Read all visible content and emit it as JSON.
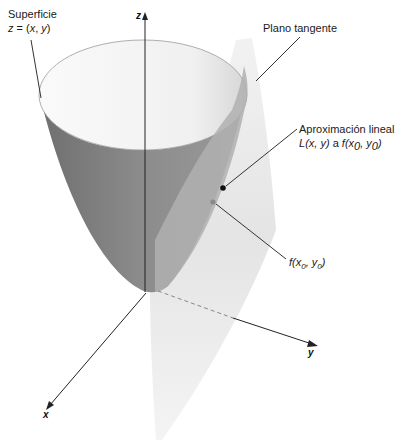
{
  "figure": {
    "colors": {
      "background": "#ffffff",
      "surface_outer": "#8f8f8f",
      "surface_outer_dark": "#7a7a7a",
      "surface_inner": "#f3f3f3",
      "surface_inner_shade": "#d9d9d9",
      "plane": "#e6e6e6",
      "plane_on_surface": "#b3b3b3",
      "point_linear": "#111111",
      "point_surface": "#8a8a8a",
      "leader_line": "#333333",
      "axis": "#222222"
    },
    "labels": {
      "surface": {
        "line1": "Superficie",
        "line2_prefix": "z",
        "line2_rest": " = (",
        "line2_x": "x",
        "line2_sep": ", ",
        "line2_y": "y",
        "line2_end": ")"
      },
      "tangent_plane": "Plano tangente",
      "linear_approx": {
        "line1": "Aproximación lineal",
        "L": "L",
        "args": "(x, y)",
        "a": " a ",
        "f": "f",
        "point": "(x",
        "sub0a": "0",
        "comma": ", y",
        "sub0b": "0",
        "close": ")"
      },
      "point_label": {
        "f": "f",
        "open": "(x",
        "sub0a": "0",
        "comma": ", y",
        "sub0b": "0",
        "close": ")"
      }
    },
    "axes": {
      "x": "x",
      "y": "y",
      "z": "z"
    }
  }
}
